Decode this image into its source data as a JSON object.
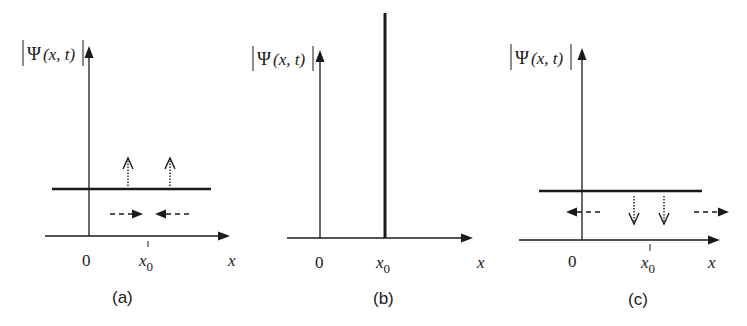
{
  "figure": {
    "panels": [
      {
        "id": "a",
        "caption": "(a)",
        "y_label_psi": "Ψ",
        "y_label_args": "(x, t)",
        "origin_label": "0",
        "x0_label_base": "x",
        "x0_label_sub": "0",
        "x_axis_label": "x",
        "curve": "horizontal-level",
        "vertical_arrows": "up (dotted)",
        "horizontal_arrows": "inward toward x0 (dashed)"
      },
      {
        "id": "b",
        "caption": "(b)",
        "y_label_psi": "Ψ",
        "y_label_args": "(x, t)",
        "origin_label": "0",
        "x0_label_base": "x",
        "x0_label_sub": "0",
        "x_axis_label": "x",
        "curve": "delta-spike-at-x0"
      },
      {
        "id": "c",
        "caption": "(c)",
        "y_label_psi": "Ψ",
        "y_label_args": "(x, t)",
        "origin_label": "0",
        "x0_label_base": "x",
        "x0_label_sub": "0",
        "x_axis_label": "x",
        "curve": "horizontal-level",
        "vertical_arrows": "down (dotted)",
        "horizontal_arrows": "outward away from x0 (dashed)"
      }
    ]
  },
  "colors": {
    "ink": "#1a1a1a",
    "background": "#ffffff"
  }
}
